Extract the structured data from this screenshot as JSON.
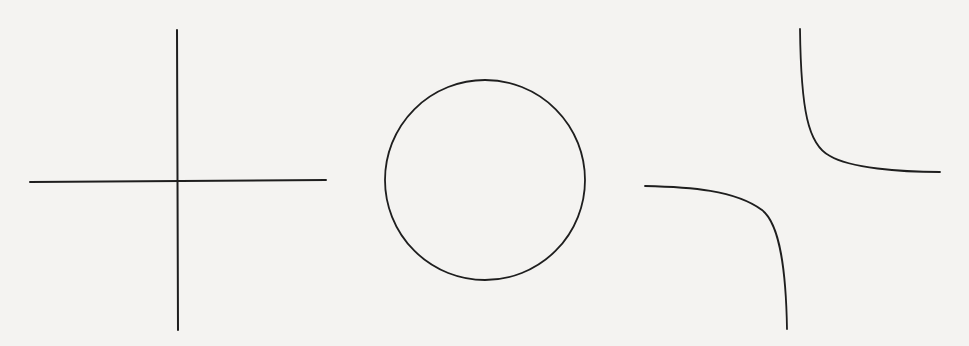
{
  "canvas": {
    "width": 969,
    "height": 346,
    "background": "#f4f3f1",
    "stroke": "#1e1e1e"
  },
  "figures": [
    {
      "name": "cross",
      "description": "Two perpendicular intersecting lines (degenerate conic: pair of lines)",
      "vertical": {
        "x1": 177,
        "y1": 30,
        "x2": 178,
        "y2": 330
      },
      "horizontal": {
        "x1": 30,
        "y1": 182,
        "x2": 326,
        "y2": 180
      }
    },
    {
      "name": "circle",
      "description": "Circle",
      "cx": 485,
      "cy": 180,
      "r": 100
    },
    {
      "name": "hyperbola",
      "description": "Rectangular hyperbola (xy = c) with two branches",
      "upper_branch": "M800 29 C 801 110, 808 145, 830 156 C 850 168, 900 172, 940 172",
      "lower_branch": "M645 186 C 690 187, 735 190, 762 210 C 780 224, 786 270, 787 329"
    }
  ]
}
